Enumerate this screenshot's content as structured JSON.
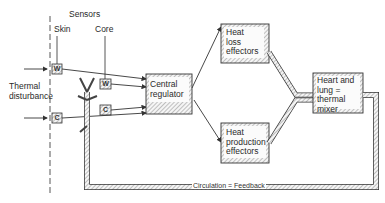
{
  "diagram": {
    "labels": {
      "sensors": "Sensors",
      "skin": "Skin",
      "core": "Core",
      "thermal_disturbance": "Thermal\ndisturbance"
    },
    "sensor_nodes": {
      "skin_warm": "W",
      "skin_cold": "C",
      "core_warm": "W",
      "core_cold": "C"
    },
    "boxes": {
      "central_regulator": "Central\nregulator",
      "heat_loss": "Heat\nloss\neffectors",
      "heat_production": "Heat\nproduction\neffectors",
      "heart_lung": "Heart and\nlung =\nthermal\nmixer"
    },
    "feedback_label": "Circulation = Feedback",
    "colors": {
      "line": "#333333",
      "hatch": "#8a8a8a",
      "box_fill": "#f4f4f4"
    }
  }
}
